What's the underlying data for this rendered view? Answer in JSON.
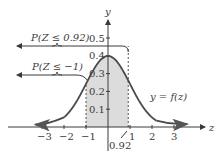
{
  "chart_data": {
    "type": "area",
    "title": "",
    "xlabel": "z",
    "ylabel": "y",
    "xlim": [
      -3.5,
      4
    ],
    "ylim": [
      0,
      0.55
    ],
    "grid": false,
    "x_ticks": [
      {
        "value": -3,
        "label": "−3"
      },
      {
        "value": -2,
        "label": "−2"
      },
      {
        "value": -1,
        "label": "−1"
      },
      {
        "value": 1,
        "label": "1"
      },
      {
        "value": 2,
        "label": "2"
      },
      {
        "value": 3,
        "label": "3"
      }
    ],
    "y_ticks": [
      {
        "value": 0.1,
        "label": "0.1"
      },
      {
        "value": 0.2,
        "label": "0.2"
      },
      {
        "value": 0.3,
        "label": "0.3"
      },
      {
        "value": 0.4,
        "label": "0.4"
      },
      {
        "value": 0.5,
        "label": "0.5"
      }
    ],
    "curve": {
      "name": "standard normal density",
      "label": "y = f(z)",
      "function": "f(z) = exp(-z^2/2)/sqrt(2*pi)",
      "domain": [
        -3.3,
        3.5
      ]
    },
    "shaded_region": {
      "from": -1,
      "to": 0.92,
      "color": "#dcdcdc"
    },
    "marked_value": {
      "value": 0.92,
      "label": "0.92"
    },
    "annotations": [
      {
        "text": "P(Z ≤ 0.92)",
        "refers_to_bound": 0.92
      },
      {
        "text": "P(Z ≤ −1)",
        "refers_to_bound": -1
      }
    ],
    "colors": {
      "curve": "#4a4a4a",
      "axis": "#3a3a3a",
      "shade": "#dcdcdc"
    }
  }
}
